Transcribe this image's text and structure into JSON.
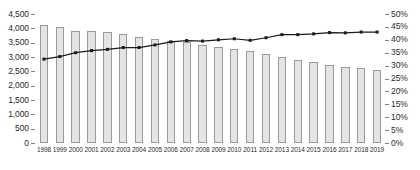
{
  "chart_data": {
    "type": "bar",
    "title": "",
    "subtitle": "",
    "xlabel": "",
    "ylabel": "",
    "grid": false,
    "legend_position": "none",
    "categories": [
      "1998",
      "1999",
      "2000",
      "2001",
      "2002",
      "2003",
      "2004",
      "2005",
      "2006",
      "2007",
      "2008",
      "2009",
      "2010",
      "2011",
      "2012",
      "2013",
      "2014",
      "2015",
      "2016",
      "2017",
      "2018",
      "2019"
    ],
    "series": [
      {
        "name": "Count",
        "type": "bar",
        "axis": "left",
        "values": [
          4120,
          4030,
          3920,
          3900,
          3870,
          3800,
          3710,
          3630,
          3550,
          3510,
          3410,
          3340,
          3280,
          3210,
          3120,
          3010,
          2910,
          2810,
          2730,
          2660,
          2600,
          2560
        ]
      },
      {
        "name": "Share",
        "type": "line",
        "axis": "right",
        "values": [
          32.5,
          33.5,
          35.0,
          35.8,
          36.3,
          37.0,
          37.0,
          38.0,
          39.2,
          39.7,
          39.5,
          40.0,
          40.4,
          39.8,
          40.8,
          42.0,
          42.0,
          42.3,
          42.8,
          42.7,
          43.0,
          43.0
        ]
      }
    ],
    "y_axis_left": {
      "min": 0,
      "max": 4500,
      "step": 500,
      "ticks": [
        "0",
        "500",
        "1,000",
        "1,500",
        "2,000",
        "2,500",
        "3,000",
        "3,500",
        "4,000",
        "4,500"
      ]
    },
    "y_axis_right": {
      "min": 0,
      "max": 50,
      "step": 5,
      "suffix": "%",
      "ticks": [
        "0%",
        "5%",
        "10%",
        "15%",
        "20%",
        "25%",
        "30%",
        "35%",
        "40%",
        "45%",
        "50%"
      ]
    },
    "colors": {
      "bar_fill": "#e4e4e4",
      "bar_border": "#9a9a9a",
      "line": "#1a1a1a",
      "marker": "#1a1a1a",
      "axis": "#808080",
      "text": "#2b2b2b"
    }
  }
}
